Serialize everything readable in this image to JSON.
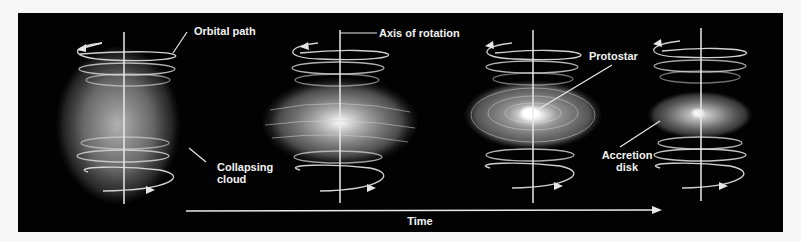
{
  "figure": {
    "background_color": "#020202",
    "line_color": "#e6e6e6",
    "labels": {
      "orbital_path": "Orbital path",
      "axis_of_rotation": "Axis of rotation",
      "protostar": "Protostar",
      "accretion_disk_line1": "Accretion",
      "accretion_disk_line2": "disk",
      "collapsing_cloud_line1": "Collapsing",
      "collapsing_cloud_line2": "cloud",
      "time": "Time"
    },
    "stages": [
      {
        "name": "Collapsing cloud",
        "shape": "spherical cloud"
      },
      {
        "name": "Flattening cloud",
        "shape": "flattened cloud"
      },
      {
        "name": "Protostar with disk",
        "shape": "disk with bright protostar"
      },
      {
        "name": "Accretion disk",
        "shape": "thin disk"
      }
    ]
  }
}
